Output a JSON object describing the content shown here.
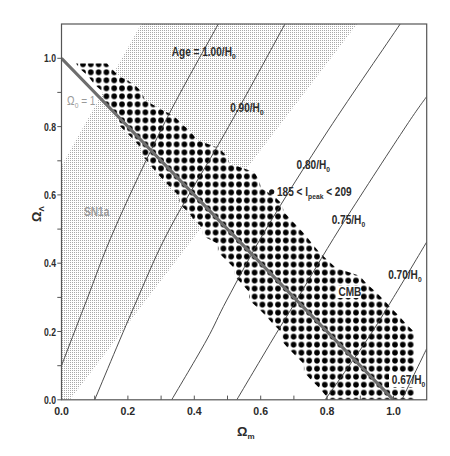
{
  "chart_data": {
    "type": "line",
    "title": "",
    "xlabel": {
      "main": "Ω",
      "sub": "m"
    },
    "ylabel": {
      "main": "Ω",
      "sub": "Λ"
    },
    "xlim": [
      0,
      1.1
    ],
    "ylim": [
      0,
      1.1
    ],
    "xticks": [
      0.0,
      0.2,
      0.4,
      0.6,
      0.8,
      1.0
    ],
    "xtick_labels": [
      "0.0",
      "0.2",
      "0.4",
      "0.6",
      "0.8",
      "1.0"
    ],
    "yticks": [
      0.0,
      0.2,
      0.4,
      0.6,
      0.8,
      1.0
    ],
    "ytick_labels": [
      "0.0",
      "0.2",
      "0.4",
      "0.6",
      "0.8",
      "1.0"
    ],
    "minor_tick_step": 0.1,
    "grid": false,
    "legend": null,
    "series": [
      {
        "name": "Age = 1.00/H0",
        "age_H0": 1.0,
        "points": [
          [
            0.0,
            0.1
          ],
          [
            0.076,
            0.292
          ],
          [
            0.161,
            0.503
          ],
          [
            0.312,
            0.814
          ],
          [
            0.472,
            1.1
          ]
        ]
      },
      {
        "name": "Age = 0.90/H0",
        "age_H0": 0.9,
        "points": [
          [
            0.1,
            0.0
          ],
          [
            0.227,
            0.292
          ],
          [
            0.327,
            0.503
          ],
          [
            0.492,
            0.78
          ],
          [
            0.673,
            1.1
          ]
        ]
      },
      {
        "name": "Age = 0.80/H0",
        "age_H0": 0.8,
        "points": [
          [
            0.332,
            0.0
          ],
          [
            0.437,
            0.175
          ],
          [
            0.498,
            0.292
          ],
          [
            0.618,
            0.503
          ],
          [
            0.804,
            0.79
          ],
          [
            1.02,
            1.1
          ]
        ]
      },
      {
        "name": "Age = 0.75/H0",
        "age_H0": 0.75,
        "points": [
          [
            0.528,
            0.0
          ],
          [
            0.635,
            0.175
          ],
          [
            0.708,
            0.292
          ],
          [
            0.839,
            0.503
          ],
          [
            1.03,
            0.79
          ],
          [
            1.1,
            0.888
          ]
        ]
      },
      {
        "name": "Age = 0.70/H0",
        "age_H0": 0.7,
        "points": [
          [
            0.794,
            0.0
          ],
          [
            0.92,
            0.175
          ],
          [
            1.0,
            0.3
          ],
          [
            1.1,
            0.462
          ]
        ]
      },
      {
        "name": "Age = 0.67/H0",
        "age_H0": 0.67,
        "points": [
          [
            1.025,
            0.0
          ],
          [
            1.1,
            0.15
          ]
        ]
      },
      {
        "name": "Ω0 = 1",
        "points": [
          [
            0.0,
            1.0
          ],
          [
            1.0,
            0.0
          ]
        ]
      }
    ],
    "regions": [
      {
        "name": "SN1a",
        "polygon": [
          [
            0.0,
            0.0
          ],
          [
            0.025,
            0.0
          ],
          [
            0.89,
            1.1
          ],
          [
            0.24,
            1.1
          ],
          [
            0.0,
            0.685
          ]
        ]
      },
      {
        "name": "CMB (185 < l_peak < 209)",
        "polygon": [
          [
            0.044,
            0.985
          ],
          [
            0.137,
            0.985
          ],
          [
            0.149,
            0.972
          ],
          [
            0.173,
            0.948
          ],
          [
            0.218,
            0.925
          ],
          [
            0.242,
            0.901
          ],
          [
            0.251,
            0.878
          ],
          [
            0.294,
            0.854
          ],
          [
            0.339,
            0.831
          ],
          [
            0.363,
            0.808
          ],
          [
            0.39,
            0.784
          ],
          [
            0.408,
            0.761
          ],
          [
            0.474,
            0.737
          ],
          [
            0.498,
            0.714
          ],
          [
            0.507,
            0.691
          ],
          [
            0.58,
            0.667
          ],
          [
            0.595,
            0.644
          ],
          [
            0.601,
            0.62
          ],
          [
            0.64,
            0.597
          ],
          [
            0.664,
            0.574
          ],
          [
            0.67,
            0.55
          ],
          [
            0.691,
            0.527
          ],
          [
            0.715,
            0.503
          ],
          [
            0.737,
            0.48
          ],
          [
            0.755,
            0.457
          ],
          [
            0.776,
            0.433
          ],
          [
            0.8,
            0.41
          ],
          [
            0.827,
            0.386
          ],
          [
            0.898,
            0.363
          ],
          [
            0.92,
            0.339
          ],
          [
            0.947,
            0.316
          ],
          [
            0.971,
            0.292
          ],
          [
            0.993,
            0.269
          ],
          [
            1.017,
            0.245
          ],
          [
            1.038,
            0.222
          ],
          [
            1.062,
            0.199
          ],
          [
            1.062,
            0.0
          ],
          [
            0.797,
            0.0
          ],
          [
            0.797,
            0.011
          ],
          [
            0.776,
            0.035
          ],
          [
            0.752,
            0.058
          ],
          [
            0.73,
            0.081
          ],
          [
            0.73,
            0.105
          ],
          [
            0.706,
            0.128
          ],
          [
            0.682,
            0.152
          ],
          [
            0.661,
            0.175
          ],
          [
            0.661,
            0.199
          ],
          [
            0.637,
            0.222
          ],
          [
            0.616,
            0.245
          ],
          [
            0.592,
            0.269
          ],
          [
            0.565,
            0.292
          ],
          [
            0.565,
            0.316
          ],
          [
            0.544,
            0.339
          ],
          [
            0.52,
            0.363
          ],
          [
            0.52,
            0.386
          ],
          [
            0.495,
            0.41
          ],
          [
            0.471,
            0.433
          ],
          [
            0.471,
            0.457
          ],
          [
            0.426,
            0.48
          ],
          [
            0.426,
            0.503
          ],
          [
            0.399,
            0.527
          ],
          [
            0.381,
            0.55
          ],
          [
            0.354,
            0.574
          ],
          [
            0.354,
            0.597
          ],
          [
            0.33,
            0.62
          ],
          [
            0.306,
            0.644
          ],
          [
            0.285,
            0.667
          ],
          [
            0.264,
            0.691
          ],
          [
            0.245,
            0.714
          ],
          [
            0.239,
            0.737
          ],
          [
            0.218,
            0.761
          ],
          [
            0.194,
            0.784
          ],
          [
            0.17,
            0.808
          ],
          [
            0.17,
            0.831
          ],
          [
            0.149,
            0.854
          ],
          [
            0.125,
            0.878
          ],
          [
            0.125,
            0.901
          ],
          [
            0.098,
            0.925
          ],
          [
            0.08,
            0.948
          ],
          [
            0.053,
            0.972
          ]
        ]
      }
    ],
    "annotations": [
      {
        "text": "Age = 1.00/H",
        "sub": "0",
        "pos": [
          0.332,
          1.007
        ]
      },
      {
        "text": "0.90/H",
        "sub": "0",
        "pos": [
          0.508,
          0.843
        ]
      },
      {
        "text": "0.80/H",
        "sub": "0",
        "pos": [
          0.708,
          0.676
        ]
      },
      {
        "text": "185 < l",
        "sub": "peak",
        "suffix": " < 209",
        "pos": [
          0.649,
          0.598
        ],
        "marker": [
          0.633,
          0.609
        ]
      },
      {
        "text": "0.75/H",
        "sub": "0",
        "pos": [
          0.814,
          0.515
        ]
      },
      {
        "text": "0.70/H",
        "sub": "0",
        "pos": [
          0.984,
          0.354
        ]
      },
      {
        "text": "CMB",
        "pos": [
          0.834,
          0.305
        ]
      },
      {
        "text": "0.67/H",
        "sub": "0",
        "pos": [
          0.995,
          0.045
        ]
      },
      {
        "text": "Ω",
        "sub": "0",
        "suffix": " = 1",
        "pos": [
          0.017,
          0.862
        ]
      },
      {
        "text": "SN1a",
        "pos": [
          0.068,
          0.537
        ]
      }
    ]
  },
  "colors": {
    "contour": "#3a3a3a",
    "flat_line": "#6e6e6e",
    "cmb_dots": "#000000",
    "sn1a_stipple": "#a9a9a9",
    "frame": "#555555",
    "label_dark": "#2b2b2b",
    "label_gray": "#9a9a9a"
  }
}
